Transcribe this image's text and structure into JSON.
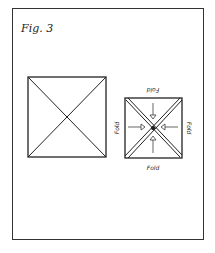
{
  "figure": {
    "label": "Fig. 3",
    "left_square": {
      "description": "square with two diagonals"
    },
    "right_square": {
      "description": "square with doubled diagonals and inward arrows",
      "fold_labels": {
        "top": "Fold",
        "bottom": "Fold",
        "left": "Fold",
        "right": "Fold"
      }
    }
  }
}
